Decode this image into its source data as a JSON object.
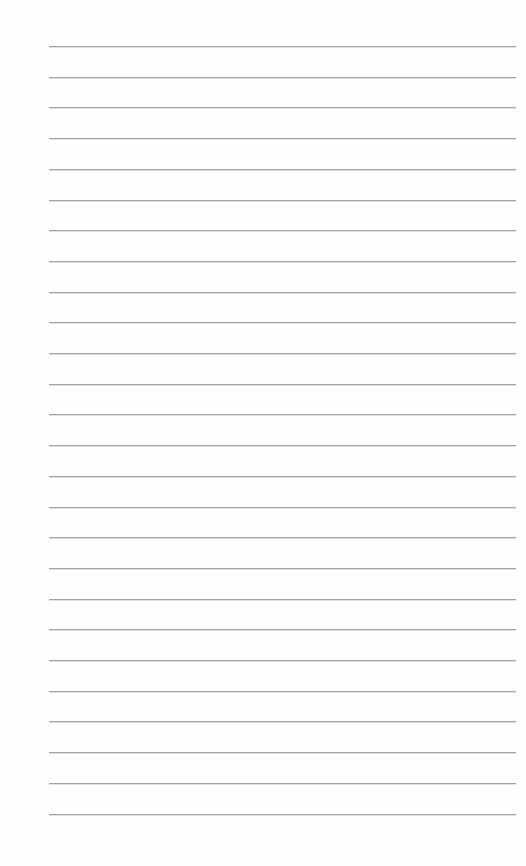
{
  "page": {
    "type": "lined-paper",
    "background_color": "#fefefe",
    "line_color": "#a3a3a3",
    "line_count": 26,
    "first_line_y": 46,
    "line_spacing": 30.7,
    "line_left": 49,
    "line_right": 516
  }
}
